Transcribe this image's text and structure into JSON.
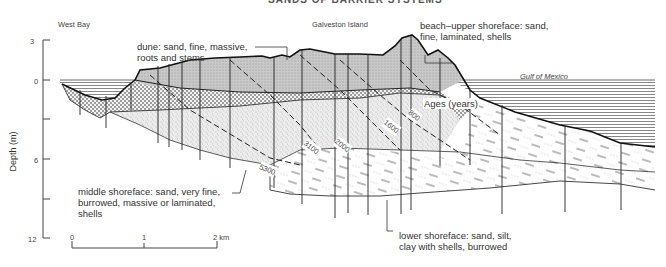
{
  "figure": {
    "title_partial": "SANDS OF BARRIER SYSTEMS",
    "place_labels": {
      "left": "West Bay",
      "center": "Galveston Island",
      "right": "Gulf of Mexico"
    },
    "y_axis": {
      "label": "Depth (m)",
      "ticks": [
        "3",
        "0",
        "6",
        "12"
      ]
    },
    "scale_bar": {
      "ticks": [
        "0",
        "1",
        "2 km"
      ]
    },
    "facies_labels": {
      "dune": [
        "dune: sand, fine, massive,",
        "roots and stems"
      ],
      "beach": [
        "beach–upper shoreface: sand,",
        "fine, laminated, shells"
      ],
      "middle": [
        "middle shoreface: sand, very fine,",
        "burrowed, massive or laminated,",
        "shells"
      ],
      "lower": [
        "lower shoreface: sand, silt,",
        "clay with shells, burrowed"
      ]
    },
    "ages": {
      "label": "Ages (years)",
      "isochrons": [
        "800",
        "1600",
        "2000",
        "3100",
        "5300"
      ]
    },
    "colors": {
      "ink": "#222222",
      "water_lines": "#555555",
      "paper": "#ffffff"
    }
  }
}
